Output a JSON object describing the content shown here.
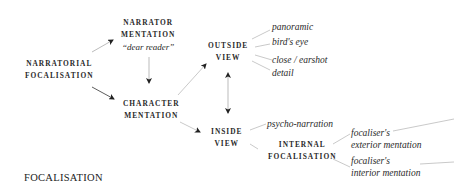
{
  "diagram": {
    "title": "FOCALISATION",
    "nodes": {
      "narratorial_focalisation": {
        "line1": "NARRATORIAL",
        "line2": "FOCALISATION"
      },
      "narrator_mentation": {
        "line1": "NARRATOR",
        "line2": "MENTATION",
        "sub": "“dear reader”"
      },
      "character_mentation": {
        "line1": "CHARACTER",
        "line2": "MENTATION"
      },
      "outside_view": {
        "line1": "OUTSIDE",
        "line2": "VIEW"
      },
      "inside_view": {
        "line1": "INSIDE",
        "line2": "VIEW"
      },
      "internal_focalisation": {
        "line1": "INTERNAL",
        "line2": "FOCALISATION"
      }
    },
    "outside_view_leaves": [
      "panoramic",
      "bird's eye",
      "close / earshot",
      "detail"
    ],
    "inside_view_leaves": [
      "psycho-narration"
    ],
    "internal_focalisation_leaves": [
      {
        "line1": "focaliser's",
        "line2": "exterior mentation"
      },
      {
        "line1": "focaliser's",
        "line2": "interior mentation"
      }
    ],
    "edges": [
      {
        "from": "narratorial_focalisation",
        "to": "narrator_mentation",
        "type": "arrow"
      },
      {
        "from": "narratorial_focalisation",
        "to": "character_mentation",
        "type": "arrow"
      },
      {
        "from": "narrator_mentation",
        "to": "character_mentation",
        "type": "arrow"
      },
      {
        "from": "character_mentation",
        "to": "outside_view",
        "type": "arrow"
      },
      {
        "from": "character_mentation",
        "to": "inside_view",
        "type": "arrow"
      },
      {
        "from": "outside_view",
        "to": "inside_view",
        "type": "double-arrow"
      },
      {
        "from": "outside_view",
        "to": "panoramic",
        "type": "line"
      },
      {
        "from": "outside_view",
        "to": "bird's eye",
        "type": "line"
      },
      {
        "from": "outside_view",
        "to": "close / earshot",
        "type": "line"
      },
      {
        "from": "outside_view",
        "to": "detail",
        "type": "line"
      },
      {
        "from": "inside_view",
        "to": "psycho-narration",
        "type": "line"
      },
      {
        "from": "inside_view",
        "to": "internal_focalisation",
        "type": "line"
      },
      {
        "from": "internal_focalisation",
        "to": "focaliser's exterior mentation",
        "type": "line"
      },
      {
        "from": "internal_focalisation",
        "to": "focaliser's interior mentation",
        "type": "line"
      }
    ],
    "colors": {
      "text": "#2a2a2a",
      "arrow": "#222222",
      "connector": "#b5b5b5",
      "background": "#ffffff"
    }
  }
}
